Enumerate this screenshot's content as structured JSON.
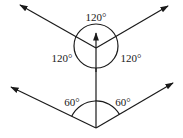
{
  "diagram": {
    "colors": {
      "stroke": "#1a1a1a",
      "background": "#ffffff"
    },
    "top_figure": {
      "junction": [
        96,
        48
      ],
      "circle": {
        "cx": 96,
        "cy": 46,
        "r": 22
      },
      "vectors": [
        {
          "name": "upper-left",
          "to": [
            20,
            5
          ]
        },
        {
          "name": "upper-right",
          "to": [
            168,
            6
          ]
        },
        {
          "name": "up",
          "from": [
            96,
            70
          ],
          "to": [
            96,
            33
          ]
        }
      ],
      "labels": {
        "top": "120°",
        "left": "120°",
        "right": "120°"
      }
    },
    "bottom_figure": {
      "vertex": [
        96,
        128
      ],
      "vertical_line": {
        "from": [
          96,
          128
        ],
        "to": [
          96,
          60
        ]
      },
      "arc": {
        "cx": 96,
        "cy": 128,
        "r": 27
      },
      "vectors": [
        {
          "name": "lower-left",
          "to": [
            11,
            87
          ]
        },
        {
          "name": "lower-right",
          "to": [
            173,
            83
          ]
        }
      ],
      "labels": {
        "left": "60°",
        "right": "60°"
      }
    }
  }
}
